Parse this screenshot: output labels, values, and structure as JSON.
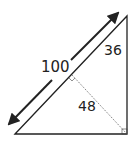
{
  "diagram": {
    "type": "right-triangle-with-altitude",
    "labels": {
      "hypotenuse_length": "100",
      "segment_upper": "36",
      "altitude": "48"
    },
    "colors": {
      "stroke": "#222222",
      "background": "#ffffff"
    }
  }
}
